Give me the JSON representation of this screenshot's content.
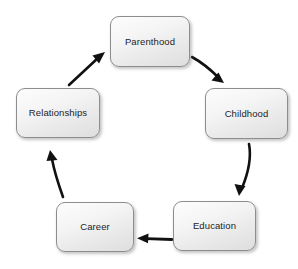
{
  "diagram": {
    "type": "cycle",
    "direction": "clockwise",
    "background_color": "#ffffff",
    "node_fill_top": "#fdfdfd",
    "node_fill_bottom": "#dedede",
    "node_border_color": "#8d8d8d",
    "text_color": "#1d1d1d",
    "arrow_color": "#111111",
    "nodes": [
      {
        "id": "parenthood",
        "label": "Parenthood"
      },
      {
        "id": "childhood",
        "label": "Childhood"
      },
      {
        "id": "education",
        "label": "Education"
      },
      {
        "id": "career",
        "label": "Career"
      },
      {
        "id": "relationships",
        "label": "Relationships"
      }
    ],
    "edges": [
      {
        "from": "Parenthood",
        "to": "Childhood",
        "style": "curved-arrow"
      },
      {
        "from": "Childhood",
        "to": "Education",
        "style": "curved-arrow"
      },
      {
        "from": "Education",
        "to": "Career",
        "style": "straight-arrow"
      },
      {
        "from": "Career",
        "to": "Relationships",
        "style": "curved-arrow"
      },
      {
        "from": "Relationships",
        "to": "Parenthood",
        "style": "straight-arrow"
      }
    ]
  }
}
